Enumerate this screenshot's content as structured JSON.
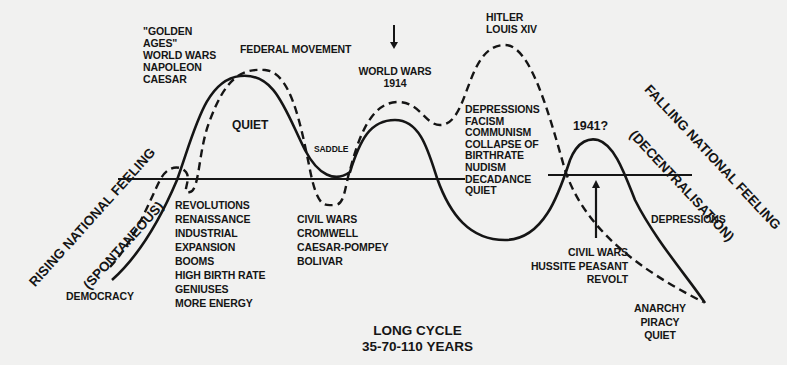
{
  "diagram": {
    "title": "LONG CYCLE",
    "subtitle": "35-70-110 YEARS",
    "left_axis_label": {
      "line1": "RISING NATIONAL FEELING",
      "line2": "(SPONTANEOUS)"
    },
    "right_axis_label": {
      "line1": "FALLING NATIONAL FEELING",
      "line2": "(DECENTRALISATION)"
    },
    "legend_curves": [
      {
        "name": "solid-curve",
        "style": "solid"
      },
      {
        "name": "dashed-curve",
        "style": "dashed"
      }
    ],
    "annotations": {
      "golden_ages": "\"GOLDEN\nAGES\"\nWORLD WARS\nNAPOLEON\nCAESAR",
      "federal_movement": "FEDERAL MOVEMENT",
      "quiet_first_peak": "QUIET",
      "saddle": "SADDLE",
      "world_wars_1914": "WORLD WARS\n1914",
      "hitler_louis": "HITLER\nLOUIS XIV",
      "depressions_list": "DEPRESSIONS\nFACISM\nCOMMUNISM\nCOLLAPSE OF\nBIRTHRATE\nNUDISM\nDECADANCE\nQUIET",
      "year_1941": "1941?",
      "revolutions_list": "REVOLUTIONS\nRENAISSANCE\nINDUSTRIAL\nEXPANSION\nBOOMS\nHIGH BIRTH RATE\nGENIUSES\nMORE ENERGY",
      "civil_wars_list": "CIVIL WARS\nCROMWELL\nCAESAR-POMPEY\nBOLIVAR",
      "democracy": "DEMOCRACY",
      "hussite_list": "CIVIL WARS\nHUSSITE PEASANT\nREVOLT",
      "depressions_right": "DEPRESSIONS",
      "anarchy_list": "ANARCHY\nPIRACY\nQUIET"
    },
    "colors": {
      "background": "#f1f1f0",
      "ink": "#151515"
    }
  }
}
